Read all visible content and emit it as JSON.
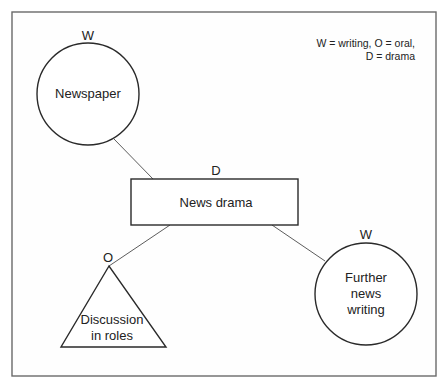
{
  "diagram": {
    "legend": {
      "line1": "W = writing, O = oral,",
      "line2": "D = drama"
    },
    "nodes": [
      {
        "id": "newspaper",
        "shape": "circle",
        "tag": "W",
        "label_lines": [
          "Newspaper"
        ]
      },
      {
        "id": "news-drama",
        "shape": "rectangle",
        "tag": "D",
        "label_lines": [
          "News drama"
        ]
      },
      {
        "id": "discussion-in-roles",
        "shape": "triangle",
        "tag": "O",
        "label_lines": [
          "Discussion",
          "in roles"
        ]
      },
      {
        "id": "further-news-writing",
        "shape": "circle",
        "tag": "W",
        "label_lines": [
          "Further",
          "news",
          "writing"
        ]
      }
    ],
    "edges": [
      {
        "from": "newspaper",
        "to": "news-drama"
      },
      {
        "from": "news-drama",
        "to": "discussion-in-roles"
      },
      {
        "from": "news-drama",
        "to": "further-news-writing"
      }
    ],
    "colors": {
      "line": "#2a2a2a",
      "text": "#222222",
      "background": "#ffffff"
    }
  }
}
